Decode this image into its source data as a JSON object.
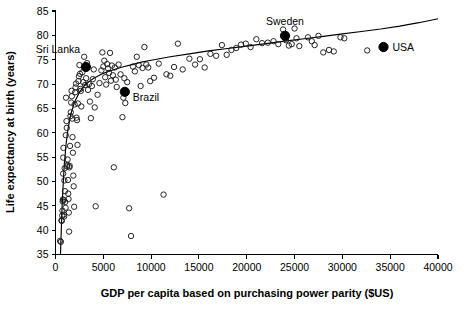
{
  "chart_data": {
    "type": "scatter",
    "title": "",
    "xlabel": "GDP per capita based on purchasing power parity ($US)",
    "ylabel": "Life expectancy at birth (years)",
    "xlim": [
      0,
      40000
    ],
    "ylim": [
      35,
      85
    ],
    "xticks": [
      0,
      5000,
      10000,
      15000,
      20000,
      25000,
      30000,
      35000,
      40000
    ],
    "yticks": [
      35,
      40,
      45,
      50,
      55,
      60,
      65,
      70,
      75,
      80,
      85
    ],
    "xtick_labels": [
      "0",
      "5000",
      "10000",
      "15000",
      "20000",
      "25000",
      "30000",
      "35000",
      "40000"
    ],
    "ytick_labels": [
      "35",
      "40",
      "45",
      "50",
      "55",
      "60",
      "65",
      "70",
      "75",
      "80",
      "85"
    ],
    "grid": false,
    "legend": false,
    "marker_style": "open-circle",
    "series": [
      {
        "name": "Countries",
        "marker": "open-circle",
        "points": [
          [
            480,
            37.8
          ],
          [
            560,
            37.6
          ],
          [
            620,
            42.0
          ],
          [
            660,
            41.9
          ],
          [
            700,
            43.0
          ],
          [
            730,
            44.0
          ],
          [
            750,
            45.9
          ],
          [
            770,
            46.3
          ],
          [
            800,
            51.6
          ],
          [
            810,
            54.9
          ],
          [
            830,
            56.9
          ],
          [
            860,
            46.2
          ],
          [
            880,
            43.2
          ],
          [
            900,
            42.8
          ],
          [
            930,
            50.2
          ],
          [
            960,
            52.7
          ],
          [
            990,
            48.0
          ],
          [
            1020,
            45.8
          ],
          [
            1050,
            44.6
          ],
          [
            1080,
            59.5
          ],
          [
            1100,
            67.2
          ],
          [
            1150,
            62.4
          ],
          [
            1180,
            61.0
          ],
          [
            1210,
            53.1
          ],
          [
            1240,
            53.4
          ],
          [
            1270,
            54.5
          ],
          [
            1300,
            50.3
          ],
          [
            1330,
            47.5
          ],
          [
            1360,
            46.4
          ],
          [
            1390,
            43.6
          ],
          [
            1420,
            39.7
          ],
          [
            1450,
            52.9
          ],
          [
            1480,
            53.2
          ],
          [
            1520,
            57.3
          ],
          [
            1560,
            63.4
          ],
          [
            1600,
            64.2
          ],
          [
            1640,
            66.2
          ],
          [
            1680,
            68.6
          ],
          [
            1700,
            67.5
          ],
          [
            1740,
            62.9
          ],
          [
            1780,
            59.1
          ],
          [
            1820,
            55.9
          ],
          [
            1860,
            51.2
          ],
          [
            1900,
            49.0
          ],
          [
            1950,
            44.8
          ],
          [
            2000,
            65.8
          ],
          [
            2050,
            68.3
          ],
          [
            2100,
            69.3
          ],
          [
            2150,
            70.1
          ],
          [
            2200,
            63.1
          ],
          [
            2250,
            62.6
          ],
          [
            2300,
            57.5
          ],
          [
            2350,
            66.0
          ],
          [
            2400,
            70.6
          ],
          [
            2450,
            71.6
          ],
          [
            2500,
            73.9
          ],
          [
            2560,
            72.1
          ],
          [
            2600,
            69.0
          ],
          [
            2650,
            68.6
          ],
          [
            2700,
            65.4
          ],
          [
            2800,
            72.4
          ],
          [
            2900,
            70.4
          ],
          [
            3000,
            75.6
          ],
          [
            3100,
            69.8
          ],
          [
            3200,
            71.2
          ],
          [
            3300,
            74.3
          ],
          [
            3400,
            68.8
          ],
          [
            3500,
            70.0
          ],
          [
            3600,
            66.4
          ],
          [
            3700,
            63.0
          ],
          [
            3800,
            69.6
          ],
          [
            3900,
            71.0
          ],
          [
            4000,
            73.0
          ],
          [
            4100,
            65.2
          ],
          [
            4200,
            44.9
          ],
          [
            4400,
            67.8
          ],
          [
            4600,
            70.2
          ],
          [
            4800,
            72.8
          ],
          [
            4900,
            76.5
          ],
          [
            5000,
            73.6
          ],
          [
            5100,
            74.8
          ],
          [
            5200,
            71.4
          ],
          [
            5300,
            69.9
          ],
          [
            5400,
            74.1
          ],
          [
            5500,
            73.2
          ],
          [
            5600,
            72.3
          ],
          [
            5700,
            76.4
          ],
          [
            5800,
            70.7
          ],
          [
            5900,
            73.8
          ],
          [
            6000,
            71.8
          ],
          [
            6100,
            52.9
          ],
          [
            6200,
            73.4
          ],
          [
            6300,
            70.9
          ],
          [
            6400,
            69.4
          ],
          [
            6600,
            74.0
          ],
          [
            6800,
            72.0
          ],
          [
            7000,
            63.2
          ],
          [
            7100,
            67.2
          ],
          [
            7200,
            71.2
          ],
          [
            7300,
            66.1
          ],
          [
            7500,
            70.4
          ],
          [
            7700,
            44.5
          ],
          [
            7900,
            38.8
          ],
          [
            8100,
            73.6
          ],
          [
            8300,
            72.6
          ],
          [
            8500,
            75.6
          ],
          [
            8700,
            73.9
          ],
          [
            8900,
            69.6
          ],
          [
            9100,
            73.3
          ],
          [
            9300,
            77.6
          ],
          [
            9500,
            74.0
          ],
          [
            9700,
            73.4
          ],
          [
            9900,
            70.6
          ],
          [
            10300,
            71.3
          ],
          [
            10800,
            74.2
          ],
          [
            11300,
            47.3
          ],
          [
            11600,
            72.0
          ],
          [
            12000,
            71.7
          ],
          [
            12400,
            73.5
          ],
          [
            12800,
            78.3
          ],
          [
            13300,
            73.0
          ],
          [
            14000,
            75.2
          ],
          [
            14600,
            74.0
          ],
          [
            15100,
            75.1
          ],
          [
            15600,
            73.4
          ],
          [
            16200,
            76.2
          ],
          [
            16800,
            75.8
          ],
          [
            17400,
            78.0
          ],
          [
            17900,
            76.0
          ],
          [
            18400,
            77.0
          ],
          [
            18900,
            77.4
          ],
          [
            19400,
            78.1
          ],
          [
            19900,
            78.3
          ],
          [
            20400,
            77.6
          ],
          [
            21000,
            79.2
          ],
          [
            21600,
            78.4
          ],
          [
            22200,
            78.5
          ],
          [
            22800,
            78.8
          ],
          [
            23300,
            78.2
          ],
          [
            23800,
            81.2
          ],
          [
            24100,
            79.0
          ],
          [
            24400,
            77.9
          ],
          [
            24700,
            78.2
          ],
          [
            25000,
            81.4
          ],
          [
            25200,
            79.4
          ],
          [
            25500,
            77.8
          ],
          [
            26400,
            79.6
          ],
          [
            26800,
            78.8
          ],
          [
            27100,
            78.0
          ],
          [
            27500,
            79.9
          ],
          [
            28000,
            76.5
          ],
          [
            28600,
            77.0
          ],
          [
            29100,
            76.7
          ],
          [
            29800,
            79.6
          ],
          [
            30200,
            79.4
          ],
          [
            32600,
            76.9
          ]
        ]
      },
      {
        "name": "Highlighted countries",
        "marker": "solid-circle",
        "points": [
          {
            "label": "Sri Lanka",
            "x": 3180,
            "y": 73.5
          },
          {
            "label": "Brazil",
            "x": 7250,
            "y": 68.4
          },
          {
            "label": "Sweden",
            "x": 24000,
            "y": 79.9
          },
          {
            "label": "USA",
            "x": 34300,
            "y": 77.6
          }
        ]
      }
    ],
    "trend_line": {
      "description": "Logarithmic fit of life expectancy vs GDP per capita",
      "points": [
        [
          520,
          35.0
        ],
        [
          700,
          45.5
        ],
        [
          900,
          53.0
        ],
        [
          1100,
          57.6
        ],
        [
          1300,
          60.7
        ],
        [
          1600,
          63.8
        ],
        [
          2000,
          66.3
        ],
        [
          2500,
          68.3
        ],
        [
          3000,
          69.6
        ],
        [
          3500,
          70.5
        ],
        [
          4000,
          71.2
        ],
        [
          5000,
          72.2
        ],
        [
          6000,
          72.9
        ],
        [
          7000,
          73.5
        ],
        [
          8000,
          74.0
        ],
        [
          9000,
          74.5
        ],
        [
          10000,
          74.9
        ],
        [
          12000,
          75.6
        ],
        [
          14000,
          76.2
        ],
        [
          16000,
          76.8
        ],
        [
          18000,
          77.3
        ],
        [
          20000,
          77.8
        ],
        [
          22000,
          78.3
        ],
        [
          24000,
          78.8
        ],
        [
          26000,
          79.3
        ],
        [
          28000,
          79.8
        ],
        [
          30000,
          80.3
        ],
        [
          32000,
          80.8
        ],
        [
          34000,
          81.3
        ],
        [
          36000,
          81.9
        ],
        [
          38000,
          82.6
        ],
        [
          40000,
          83.4
        ]
      ]
    },
    "annotations": [
      {
        "text": "Sri Lanka",
        "x": 3180,
        "y": 73.5,
        "placement": "above-left"
      },
      {
        "text": "Brazil",
        "x": 7250,
        "y": 68.4,
        "placement": "right"
      },
      {
        "text": "Sweden",
        "x": 24000,
        "y": 79.9,
        "placement": "above"
      },
      {
        "text": "USA",
        "x": 34300,
        "y": 77.6,
        "placement": "right"
      }
    ]
  },
  "colors": {
    "axis": "#000000",
    "point_stroke": "#1a1a1a",
    "highlight_fill": "#000000",
    "background": "#ffffff"
  }
}
